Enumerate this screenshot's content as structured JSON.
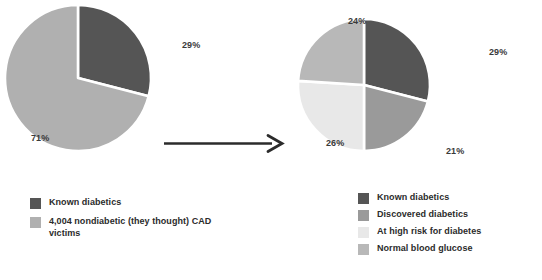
{
  "colors": {
    "known_diabetics": "#555555",
    "discovered_diabetics": "#9a9a9a",
    "at_high_risk": "#e8e8e8",
    "normal_blood_glucose": "#b8b8b8",
    "nondiabetic_cad": "#b0b0b0",
    "arrow": "#2b2b2b",
    "label_text": "#3a3a3a",
    "legend_text": "#2b2b2b",
    "slice_border": "#ffffff",
    "background": "#ffffff"
  },
  "arrow": {
    "icon": "right-arrow-icon",
    "direction": "right"
  },
  "chart_data": [
    {
      "type": "pie",
      "title": "",
      "id": "left-pie",
      "categories": [
        "Known diabetics",
        "4,004 nondiabetic (they thought) CAD victims"
      ],
      "values": [
        29,
        71
      ],
      "labels": [
        "29%",
        "71%"
      ],
      "colors": [
        "#555555",
        "#b0b0b0"
      ],
      "units": "percent",
      "start_angle_deg": 0,
      "direction": "clockwise",
      "legend_position": "below",
      "grid": false
    },
    {
      "type": "pie",
      "title": "",
      "id": "right-pie",
      "categories": [
        "Known diabetics",
        "Discovered diabetics",
        "At high risk for diabetes",
        "Normal blood glucose"
      ],
      "values": [
        29,
        21,
        26,
        24
      ],
      "labels": [
        "29%",
        "21%",
        "26%",
        "24%"
      ],
      "colors": [
        "#555555",
        "#9a9a9a",
        "#e8e8e8",
        "#b8b8b8"
      ],
      "units": "percent",
      "start_angle_deg": 0,
      "direction": "clockwise",
      "legend_position": "below",
      "grid": false
    }
  ],
  "left_chart": {
    "percent_labels": {
      "known_diabetics": "29%",
      "nondiabetic_cad": "71%"
    },
    "legend": {
      "items": [
        {
          "label": "Known diabetics",
          "color": "#555555"
        },
        {
          "label": "4,004 nondiabetic (they thought) CAD victims",
          "color": "#b0b0b0"
        }
      ]
    }
  },
  "right_chart": {
    "percent_labels": {
      "known_diabetics": "29%",
      "discovered_diabetics": "21%",
      "at_high_risk": "26%",
      "normal_blood_glucose": "24%"
    },
    "legend": {
      "items": [
        {
          "label": "Known diabetics",
          "color": "#555555"
        },
        {
          "label": "Discovered diabetics",
          "color": "#9a9a9a"
        },
        {
          "label": "At high risk for diabetes",
          "color": "#e8e8e8"
        },
        {
          "label": "Normal blood glucose",
          "color": "#b8b8b8"
        }
      ]
    }
  }
}
